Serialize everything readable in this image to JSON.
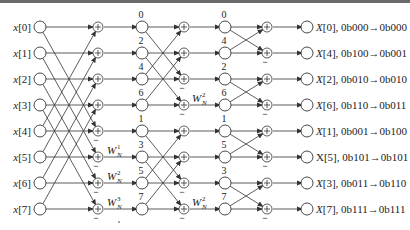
{
  "diagram": {
    "type": "radix-2 decimation-in-frequency FFT butterfly, N=8",
    "inputs": [
      "x[0]",
      "x[1]",
      "x[2]",
      "x[3]",
      "x[4]",
      "x[5]",
      "x[6]",
      "x[7]"
    ],
    "stage2_indices": [
      "0",
      "2",
      "4",
      "6",
      "1",
      "3",
      "5",
      "7"
    ],
    "stage3_indices": [
      "0",
      "4",
      "2",
      "6",
      "1",
      "5",
      "3",
      "7"
    ],
    "outputs": [
      "X[0], 0b000→0b000",
      "X[4], 0b100→0b001",
      "X[2], 0b010→0b010",
      "X[6], 0b110→0b011",
      "X[1], 0b001→0b100",
      "X[5], 0b101→0b101",
      "X[3], 0b011→0b110",
      "X[7], 0b111→0b111"
    ],
    "twiddles": {
      "stage1": [
        {
          "row": 5,
          "base": "W",
          "sub": "N",
          "sup": "1"
        },
        {
          "row": 6,
          "base": "W",
          "sub": "N",
          "sup": "2"
        },
        {
          "row": 7,
          "base": "W",
          "sub": "N",
          "sup": "3"
        }
      ],
      "stage2": [
        {
          "row": 3,
          "base": "W",
          "sub": "N",
          "sup": "2"
        },
        {
          "row": 7,
          "base": "W",
          "sub": "N",
          "sup": "2"
        }
      ]
    },
    "adder_symbol": "+",
    "minus_symbol": "−",
    "colors": {
      "stroke": "#333333",
      "text": "#222222",
      "rule": "#6a6a6a"
    }
  }
}
